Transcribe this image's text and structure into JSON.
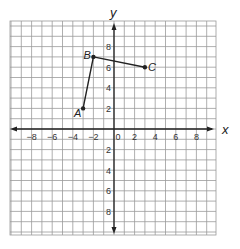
{
  "graph": {
    "x_axis_label": "x",
    "y_axis_label": "y",
    "x_range": [
      -10,
      10
    ],
    "y_range": [
      -10,
      10
    ],
    "x_tick_labels": [
      "−8",
      "−6",
      "−4",
      "−2",
      "0",
      "2",
      "4",
      "6",
      "8"
    ],
    "x_tick_values": [
      -8,
      -6,
      -4,
      -2,
      0,
      2,
      4,
      6,
      8
    ],
    "y_tick_labels": [
      "8",
      "6",
      "4",
      "2",
      "2",
      "4",
      "6",
      "8"
    ],
    "y_tick_values": [
      8,
      6,
      4,
      2,
      -2,
      -4,
      -6,
      -8
    ],
    "points": [
      {
        "label": "A",
        "x": -3,
        "y": 2
      },
      {
        "label": "B",
        "x": -2,
        "y": 7
      },
      {
        "label": "C",
        "x": 3,
        "y": 6
      }
    ],
    "segments": [
      [
        "A",
        "B"
      ],
      [
        "B",
        "C"
      ]
    ],
    "colors": {
      "grid": "#9a9a9a",
      "axis": "#222222",
      "line": "#222222"
    }
  }
}
